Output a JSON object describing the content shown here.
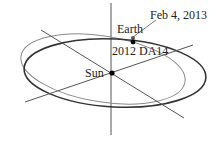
{
  "diagram": {
    "labels": {
      "date": "Feb 4, 2013",
      "earth": "Earth",
      "asteroid": "2012 DA14",
      "sun": "Sun"
    },
    "colors": {
      "earth_orbit": "#333333",
      "asteroid_orbit": "#888888",
      "axes": "#444444",
      "points": "#000000"
    }
  }
}
